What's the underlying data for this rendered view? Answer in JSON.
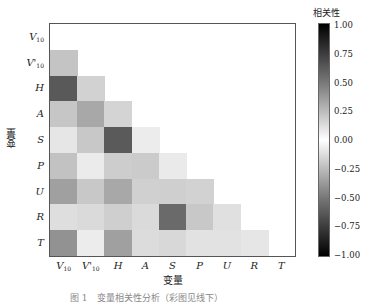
{
  "chart_data": {
    "type": "heatmap",
    "title": "",
    "xlabel": "变量",
    "ylabel": "变量",
    "variables": [
      "V10",
      "V'10",
      "H",
      "A",
      "S",
      "P",
      "U",
      "R",
      "T"
    ],
    "x_tick_labels": [
      {
        "base": "V",
        "sub": "10"
      },
      {
        "base": "V'",
        "sub": "10"
      },
      {
        "base": "H",
        "sub": ""
      },
      {
        "base": "A",
        "sub": ""
      },
      {
        "base": "S",
        "sub": ""
      },
      {
        "base": "P",
        "sub": ""
      },
      {
        "base": "U",
        "sub": ""
      },
      {
        "base": "R",
        "sub": ""
      },
      {
        "base": "T",
        "sub": ""
      }
    ],
    "y_tick_labels": [
      {
        "base": "V",
        "sub": "10"
      },
      {
        "base": "V'",
        "sub": "10"
      },
      {
        "base": "H",
        "sub": ""
      },
      {
        "base": "A",
        "sub": ""
      },
      {
        "base": "S",
        "sub": ""
      },
      {
        "base": "P",
        "sub": ""
      },
      {
        "base": "U",
        "sub": ""
      },
      {
        "base": "R",
        "sub": ""
      },
      {
        "base": "T",
        "sub": ""
      }
    ],
    "mask": "upper triangle and diagonal hidden (lower triangle shown)",
    "abs_correlation_estimates": [
      [
        null,
        null,
        null,
        null,
        null,
        null,
        null,
        null,
        null
      ],
      [
        0.23,
        null,
        null,
        null,
        null,
        null,
        null,
        null,
        null
      ],
      [
        0.65,
        0.18,
        null,
        null,
        null,
        null,
        null,
        null,
        null
      ],
      [
        0.22,
        0.34,
        0.17,
        null,
        null,
        null,
        null,
        null,
        null
      ],
      [
        0.1,
        0.22,
        0.65,
        0.07,
        null,
        null,
        null,
        null,
        null
      ],
      [
        0.24,
        0.08,
        0.2,
        0.2,
        0.08,
        null,
        null,
        null,
        null
      ],
      [
        0.37,
        0.22,
        0.34,
        0.18,
        0.19,
        0.18,
        null,
        null,
        null
      ],
      [
        0.13,
        0.15,
        0.19,
        0.15,
        0.58,
        0.22,
        0.12,
        null,
        null
      ],
      [
        0.43,
        0.07,
        0.37,
        0.14,
        0.15,
        0.11,
        0.11,
        0.1,
        null
      ]
    ],
    "cell_colors": [
      [
        null,
        null,
        null,
        null,
        null,
        null,
        null,
        null,
        null
      ],
      [
        "#c4c4c4",
        null,
        null,
        null,
        null,
        null,
        null,
        null,
        null
      ],
      [
        "#595959",
        "#d2d2d2",
        null,
        null,
        null,
        null,
        null,
        null,
        null
      ],
      [
        "#c6c6c6",
        "#a8a8a8",
        "#d4d4d4",
        null,
        null,
        null,
        null,
        null,
        null
      ],
      [
        "#e6e6e6",
        "#c8c8c8",
        "#5a5a5a",
        "#ececec",
        null,
        null,
        null,
        null,
        null
      ],
      [
        "#c2c2c2",
        "#ebebeb",
        "#cdcdcd",
        "#cbcbcb",
        "#eaeaea",
        null,
        null,
        null,
        null
      ],
      [
        "#a0a0a0",
        "#c8c8c8",
        "#a8a8a8",
        "#d0d0d0",
        "#cfcfcf",
        "#d2d2d2",
        null,
        null,
        null
      ],
      [
        "#dedede",
        "#dadada",
        "#cfcfcf",
        "#dadada",
        "#6a6a6a",
        "#c8c8c8",
        "#e0e0e0",
        null,
        null
      ],
      [
        "#929292",
        "#ececec",
        "#a0a0a0",
        "#dcdcdc",
        "#d8d8d8",
        "#e2e2e2",
        "#e2e2e2",
        "#e6e6e6",
        null
      ]
    ],
    "colorbar": {
      "title": "相关性",
      "range": [
        -1.0,
        1.0
      ],
      "ticks": [
        "1.00",
        "0.75",
        "0.50",
        "0.25",
        "0.00",
        "−0.25",
        "−0.50",
        "−0.75",
        "−1.00"
      ],
      "colormap": "diverging grey: black at ±1, white at 0"
    },
    "grid": false,
    "legend_position": "right (colorbar)"
  },
  "caption": "图 1　变量相关性分析（彩图见线下）"
}
